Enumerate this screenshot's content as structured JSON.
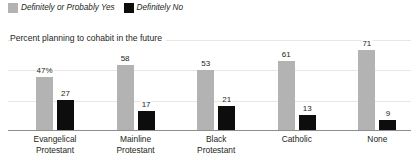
{
  "chart_data": {
    "type": "bar",
    "title": "Percent planning to cohabit in the future",
    "xlabel": "",
    "ylabel": "",
    "ylim": [
      0,
      80
    ],
    "grid": true,
    "gridlines": [
      20,
      40,
      60,
      80
    ],
    "legend_position": "top-left",
    "categories": [
      "Evangelical Protestant",
      "Mainline Protestant",
      "Black Protestant",
      "Catholic",
      "None"
    ],
    "category_lines": [
      [
        "Evangelical",
        "Protestant"
      ],
      [
        "Mainline",
        "Protestant"
      ],
      [
        "Black",
        "Protestant"
      ],
      [
        "Catholic"
      ],
      [
        "None"
      ]
    ],
    "series": [
      {
        "name": "Definitely or Probably Yes",
        "color": "#b3b3b3",
        "values": [
          47,
          58,
          53,
          61,
          71
        ],
        "labels": [
          "47%",
          "58",
          "53",
          "61",
          "71"
        ]
      },
      {
        "name": "Definitely No",
        "color": "#0d0d0d",
        "values": [
          27,
          17,
          21,
          13,
          9
        ],
        "labels": [
          "27",
          "17",
          "21",
          "13",
          "9"
        ]
      }
    ]
  },
  "legend": {
    "items": [
      {
        "label": "Definitely or Probably Yes",
        "color": "#b3b3b3"
      },
      {
        "label": "Definitely No",
        "color": "#0d0d0d"
      }
    ]
  },
  "colors": {
    "yes": "#b3b3b3",
    "no": "#0d0d0d",
    "grid": "#e9e6e4",
    "axis": "#8d8d8d",
    "text": "#231f20"
  }
}
